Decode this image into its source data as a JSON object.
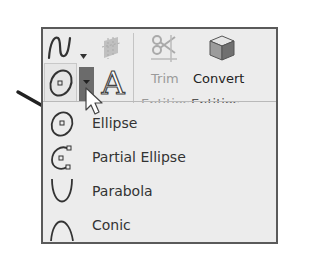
{
  "toolbar": {
    "top_row": {
      "spline_tool": {
        "icon": "spline-icon",
        "has_dropdown": true
      },
      "surface_tool": {
        "icon": "surface-icon",
        "state": "disabled"
      }
    },
    "second_row": {
      "ellipse_tool": {
        "icon": "ellipse-icon",
        "state": "active"
      },
      "ellipse_dropdown": {
        "icon": "chevron-down-icon",
        "state": "pressed"
      },
      "text_tool": {
        "icon": "text-a-icon"
      }
    },
    "trim": {
      "label": "Trim",
      "sublabel": "Entities",
      "icon": "trim-scissors-icon",
      "state": "disabled"
    },
    "convert": {
      "label": "Convert",
      "sublabel": "Entities",
      "icon": "convert-cube-icon"
    }
  },
  "dropdown_menu": {
    "items": [
      {
        "label": "Ellipse",
        "icon": "ellipse-icon"
      },
      {
        "label": "Partial Ellipse",
        "icon": "partial-ellipse-icon"
      },
      {
        "label": "Parabola",
        "icon": "parabola-icon"
      },
      {
        "label": "Conic",
        "icon": "conic-icon"
      }
    ]
  },
  "annotation": {
    "icon": "callout-arrow-icon",
    "points_to": "Ellipse"
  },
  "colors": {
    "frame_border": "#5a5a5a",
    "panel_bg": "#ececec",
    "pressed_button": "#6b6b6b",
    "text": "#333333",
    "disabled_text": "#9a9a9a"
  }
}
